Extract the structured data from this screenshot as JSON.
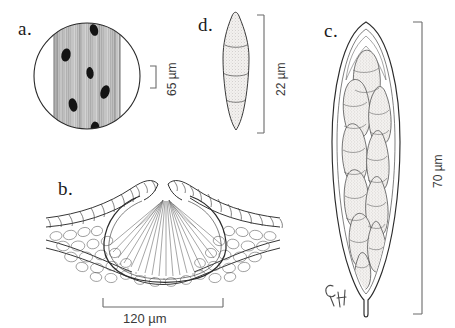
{
  "figure": {
    "type": "scientific-line-illustration",
    "background_color": "#ffffff",
    "ink_color": "#2b2b2b"
  },
  "panels": [
    {
      "id": "a",
      "label": "a.",
      "description": "circular microscope field of view containing a vertically striated band of host tissue with dark elliptical lesions",
      "scale": {
        "value": "65",
        "unit": "µm",
        "text": "65 µm",
        "orientation": "vertical",
        "bracket": "right"
      },
      "spots": [
        {
          "cx": 94,
          "cy": 30,
          "rx": 4.0,
          "ry": 6.0,
          "rot": -18
        },
        {
          "cx": 66,
          "cy": 55,
          "rx": 4.6,
          "ry": 6.6,
          "rot": 12
        },
        {
          "cx": 90,
          "cy": 73,
          "rx": 3.6,
          "ry": 6.0,
          "rot": -8
        },
        {
          "cx": 105,
          "cy": 92,
          "rx": 4.4,
          "ry": 7.0,
          "rot": 20
        },
        {
          "cx": 73,
          "cy": 105,
          "rx": 4.2,
          "ry": 6.8,
          "rot": -14
        },
        {
          "cx": 95,
          "cy": 127,
          "rx": 4.2,
          "ry": 5.4,
          "rot": 6
        }
      ]
    },
    {
      "id": "b",
      "label": "b.",
      "description": "cross section of an immersed perithecium in host leaf tissue showing palisade cells, spongy parenchyma and a cavity of radiating asci beneath an ostiole",
      "scale": {
        "value": "120",
        "unit": "µm",
        "text": "120 µm",
        "orientation": "horizontal",
        "bracket": "below"
      }
    },
    {
      "id": "c",
      "label": "c.",
      "description": "elongate clavate ascus with a thickened double wall, narrow stalk and packed multiseptate ascospores",
      "scale": {
        "value": "70",
        "unit": "µm",
        "text": "70 µm",
        "orientation": "vertical",
        "bracket": "right"
      },
      "annotation": "CH"
    },
    {
      "id": "d",
      "label": "d.",
      "description": "single fusiform ascospore with three septa dividing it into four stippled cells",
      "scale": {
        "value": "22",
        "unit": "µm",
        "text": "22 µm",
        "orientation": "vertical",
        "bracket": "right"
      },
      "septa_count": 3,
      "cell_count": 4
    }
  ]
}
